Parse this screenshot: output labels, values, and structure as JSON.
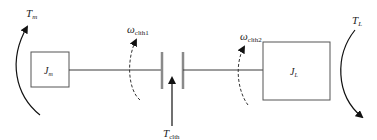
{
  "diagram": {
    "type": "two-inertia clutch drivetrain schematic",
    "motor_inertia": {
      "symbol": "J",
      "subscript": "m"
    },
    "load_inertia": {
      "symbol": "J",
      "subscript": "L"
    },
    "motor_torque": {
      "symbol": "T",
      "subscript": "m"
    },
    "load_torque": {
      "symbol": "T",
      "subscript": "L"
    },
    "clutch_torque": {
      "symbol": "T",
      "subscript": "clth"
    },
    "clutch_speed_1": {
      "symbol": "ω",
      "subscript": "clth1"
    },
    "clutch_speed_2": {
      "symbol": "ω",
      "subscript": "clth2"
    },
    "colors": {
      "line": "#3a3a3a",
      "clutch_plate": "#8a8a8a",
      "text": "#222222",
      "background": "#ffffff"
    }
  }
}
